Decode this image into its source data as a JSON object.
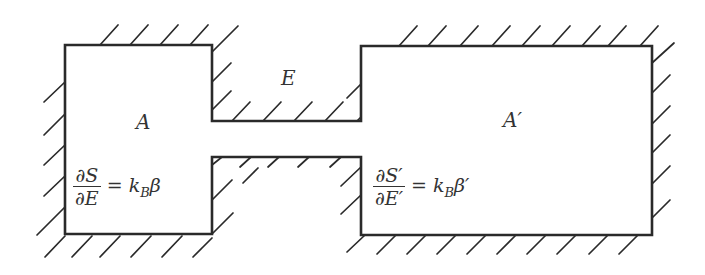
{
  "diagram": {
    "regions": {
      "left": {
        "label": "A",
        "equation": {
          "numerator": "∂S",
          "denominator": "∂E",
          "equals": "=",
          "k": "k",
          "k_sub": "B",
          "beta": "β"
        }
      },
      "right": {
        "label": "A′",
        "equation": {
          "numerator": "∂S′",
          "denominator": "∂E′",
          "equals": "=",
          "k": "k",
          "k_sub": "B",
          "beta": "β′"
        }
      },
      "channel": {
        "label": "E"
      }
    },
    "colors": {
      "stroke": "#2a2a2a",
      "text": "#333333",
      "background": "#ffffff"
    }
  }
}
